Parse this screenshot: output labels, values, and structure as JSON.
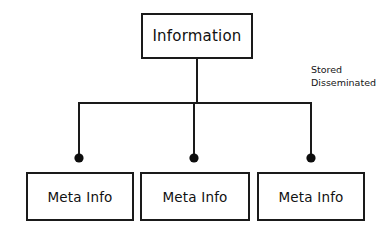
{
  "diagram": {
    "type": "tree-hierarchy",
    "background_color": "#ffffff",
    "line_color": "#1a1a1a",
    "text_color": "#111111",
    "root": {
      "label": "Information"
    },
    "annotation": {
      "line_1": "Stored",
      "line_2": "Disseminated"
    },
    "leaves": [
      {
        "label": "Meta Info"
      },
      {
        "label": "Meta Info"
      },
      {
        "label": "Meta Info"
      }
    ],
    "connectors": {
      "trunk_x": 197,
      "bus_y": 103,
      "bus_x_start": 79,
      "bus_x_end": 311,
      "branch_x": [
        79,
        194,
        311
      ],
      "endpoint_dot_y": 158,
      "endpoint_dot_radius": 4.5
    }
  }
}
